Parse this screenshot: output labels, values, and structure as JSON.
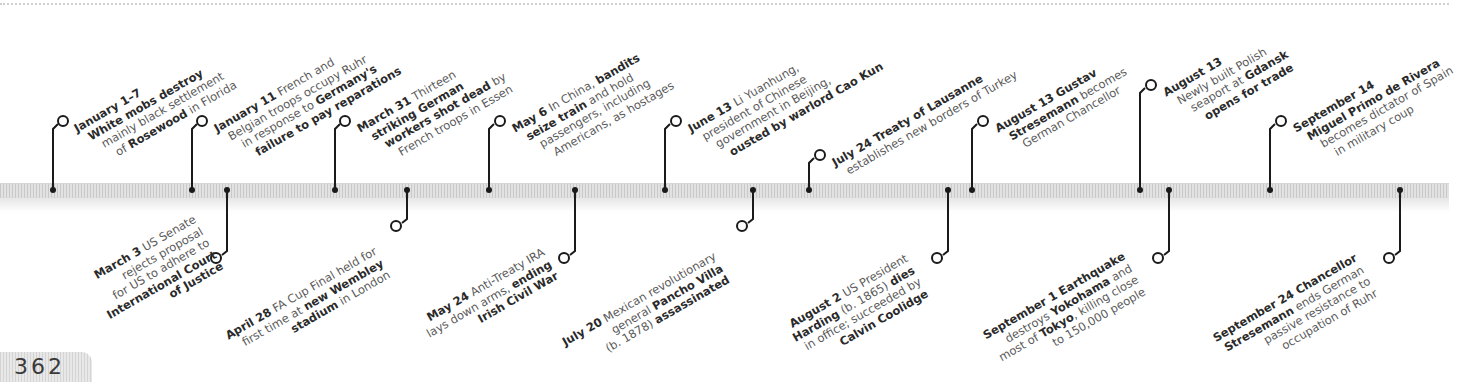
{
  "page": {
    "number": "362"
  },
  "timeline": {
    "year_context": "1923",
    "colors": {
      "bar": "#d9d9d9",
      "connector": "#1a1a1a",
      "bold_text": "#2a2a2a",
      "body_text": "#5a5a5a"
    },
    "top_events": [
      {
        "date": "January 1–7",
        "lines": [
          [
            "",
            "White mobs destroy",
            ""
          ],
          [
            "mainly black settlement",
            "",
            ""
          ],
          [
            "of ",
            "Rosewood",
            " in Florida"
          ]
        ]
      },
      {
        "date": "January 11",
        "lines": [
          [
            "",
            "",
            " French and"
          ],
          [
            "Belgian troops occupy Ruhr",
            "",
            ""
          ],
          [
            "in response to ",
            "Germany's",
            ""
          ],
          [
            "",
            "failure to pay reparations",
            ""
          ]
        ]
      },
      {
        "date": "March 31",
        "lines": [
          [
            "",
            "",
            " Thirteen"
          ],
          [
            "",
            "striking German",
            ""
          ],
          [
            "",
            "workers shot dead",
            " by"
          ],
          [
            "French troops in Essen",
            "",
            ""
          ]
        ]
      },
      {
        "date": "May 6",
        "lines": [
          [
            "In China, ",
            "bandits",
            ""
          ],
          [
            "",
            "seize train",
            " and hold"
          ],
          [
            "passengers, including",
            "",
            ""
          ],
          [
            "Americans, as hostages",
            "",
            ""
          ]
        ]
      },
      {
        "date": "June 13",
        "lines": [
          [
            "",
            "",
            " Li Yuanhung,"
          ],
          [
            "president of Chinese",
            "",
            ""
          ],
          [
            "government in Beijing,",
            "",
            ""
          ],
          [
            "",
            "ousted by warlord Cao Kun",
            ""
          ]
        ]
      },
      {
        "date": "July 24",
        "lines": [
          [
            "",
            "",
            " Treaty of Lausanne"
          ],
          [
            "establishes new borders of Turkey",
            "",
            ""
          ]
        ]
      },
      {
        "date": "August 13",
        "lines": [
          [
            "",
            "",
            " Gustav"
          ],
          [
            "",
            "Stresemann",
            " becomes"
          ],
          [
            "German Chancellor",
            "",
            ""
          ]
        ]
      },
      {
        "date": "August 13",
        "lines": [
          [
            "Newly built Polish",
            "",
            ""
          ],
          [
            "seaport at ",
            "Gdansk",
            ""
          ],
          [
            "",
            "opens for trade",
            ""
          ]
        ]
      },
      {
        "date": "September 14",
        "lines": [
          [
            "",
            "Miguel Primo de Rivera",
            ""
          ],
          [
            "becomes dictator of Spain",
            "",
            ""
          ],
          [
            "in military coup",
            "",
            ""
          ]
        ]
      }
    ],
    "top_events_text": [
      "January 1–7 White mobs destroy mainly black settlement of Rosewood in Florida",
      "January 11 French and Belgian troops occupy Ruhr in response to Germany's failure to pay reparations",
      "March 31 Thirteen striking German workers shot dead by French troops in Essen",
      "May 6 In China, bandits seize train and hold passengers, including Americans, as hostages",
      "June 13 Li Yuanhung, president of Chinese government in Beijing, ousted by warlord Cao Kun",
      "July 24 Treaty of Lausanne establishes new borders of Turkey",
      "August 13 Gustav Stresemann becomes German Chancellor",
      "August 13 Newly built Polish seaport at Gdansk opens for trade",
      "September 14 Miguel Primo de Rivera becomes dictator of Spain in military coup"
    ],
    "bottom_events_text": [
      "March 3 US Senate rejects proposal for US to adhere to International Court of Justice",
      "April 28 FA Cup Final held for first time at new Wembley stadium in London",
      "May 24 Anti-Treaty IRA lays down arms, ending Irish Civil War",
      "July 20 Mexican revolutionary general Pancho Villa (b. 1878) assassinated",
      "August 2 US President Harding (b. 1865) dies in office; succeeded by Calvin Coolidge",
      "September 1 Earthquake destroys Yokohama and most of Tokyo, killing close to 150,000 people",
      "September 24 Chancellor Stresemann ends German passive resistance to occupation of Ruhr"
    ],
    "bottom_events": [
      {
        "date": "March 3",
        "lines": [
          [
            "",
            "",
            " US Senate"
          ],
          [
            "rejects proposal",
            "",
            ""
          ],
          [
            "for US to adhere to",
            "",
            ""
          ],
          [
            "",
            "International Court",
            ""
          ],
          [
            "",
            "of Justice",
            ""
          ]
        ]
      },
      {
        "date": "April 28",
        "lines": [
          [
            "",
            "",
            " FA Cup Final held for"
          ],
          [
            "first time at ",
            "new Wembley",
            ""
          ],
          [
            "",
            "stadium",
            " in London"
          ]
        ]
      },
      {
        "date": "May 24",
        "lines": [
          [
            "",
            "",
            " Anti-Treaty IRA"
          ],
          [
            "lays down arms, ",
            "ending",
            ""
          ],
          [
            "",
            "Irish Civil War",
            ""
          ]
        ]
      },
      {
        "date": "July 20",
        "lines": [
          [
            "",
            "",
            " Mexican revolutionary"
          ],
          [
            "general ",
            "Pancho Villa",
            ""
          ],
          [
            "(b. 1878) ",
            "assassinated",
            ""
          ]
        ]
      },
      {
        "date": "August 2",
        "lines": [
          [
            "",
            "",
            " US President"
          ],
          [
            "",
            "Harding",
            " (b. 1865) "
          ],
          [
            "in office; succeeded by",
            "",
            ""
          ],
          [
            "",
            "Calvin Coolidge",
            ""
          ]
        ]
      },
      {
        "date": "September 1",
        "lines": [
          [
            "",
            "",
            " "
          ],
          [
            "destroys ",
            "Yokohama",
            " and"
          ],
          [
            "most of ",
            "Tokyo",
            ", killing close"
          ],
          [
            "to 150,000 people",
            "",
            ""
          ]
        ]
      },
      {
        "date": "September 24",
        "lines": [
          [
            "",
            "",
            " "
          ],
          [
            "",
            "Stresemann",
            " ends German"
          ],
          [
            "passive resistance to",
            "",
            ""
          ],
          [
            "occupation of Ruhr",
            "",
            ""
          ]
        ]
      }
    ],
    "labels": {
      "t0_date": "January 1–7",
      "t0_l1": "White mobs destroy",
      "t0_l2": "mainly black settlement",
      "t0_l3a": "of ",
      "t0_l3b": "Rosewood",
      "t0_l3c": " in Florida",
      "t1_date": "January 11",
      "t1_l1": " French and",
      "t1_l2": "Belgian troops occupy Ruhr",
      "t1_l3a": "in response to ",
      "t1_l3b": "Germany's",
      "t1_l4": "failure to pay reparations",
      "t2_date": "March 31",
      "t2_l1": " Thirteen",
      "t2_l2": "striking German",
      "t2_l3a": "workers shot dead",
      "t2_l3b": " by",
      "t2_l4": "French troops in Essen",
      "t3_date": "May 6",
      "t3_l1a": " In China, ",
      "t3_l1b": "bandits",
      "t3_l2a": "seize train",
      "t3_l2b": " and hold",
      "t3_l3": "passengers, including",
      "t3_l4": "Americans, as hostages",
      "t4_date": "June 13",
      "t4_l1": " Li Yuanhung,",
      "t4_l2": "president of Chinese",
      "t4_l3": "government in Beijing,",
      "t4_l4": "ousted by warlord Cao Kun",
      "t5_date": "July 24",
      "t5_l1": " Treaty of Lausanne",
      "t5_l2": "establishes new borders of Turkey",
      "t6_date": "August 13",
      "t6_l1": " Gustav",
      "t6_l2a": "Stresemann",
      "t6_l2b": " becomes",
      "t6_l3": "German Chancellor",
      "t7_date": "August 13",
      "t7_l2": "Newly built Polish",
      "t7_l3a": "seaport at ",
      "t7_l3b": "Gdansk",
      "t7_l4": "opens for trade",
      "t8_date": "September 14",
      "t8_l2": "Miguel Primo de Rivera",
      "t8_l3": "becomes dictator of Spain",
      "t8_l4": "in military coup",
      "b0_date": "March 3",
      "b0_l1": " US Senate",
      "b0_l2": "rejects proposal",
      "b0_l3": "for US to adhere to",
      "b0_l4": "International Court",
      "b0_l5": "of Justice",
      "b1_date": "April 28",
      "b1_l1": " FA Cup Final held for",
      "b1_l2a": "first time at ",
      "b1_l2b": "new Wembley",
      "b1_l3a": "stadium",
      "b1_l3b": " in London",
      "b2_date": "May 24",
      "b2_l1": " Anti-Treaty IRA",
      "b2_l2a": "lays down arms, ",
      "b2_l2b": "ending",
      "b2_l3": "Irish Civil War",
      "b3_date": "July 20",
      "b3_l1": " Mexican revolutionary",
      "b3_l2a": "general ",
      "b3_l2b": "Pancho Villa",
      "b3_l3a": "(b. 1878) ",
      "b3_l3b": "assassinated",
      "b4_date": "August 2",
      "b4_l1": " US President",
      "b4_l2a": "Harding",
      "b4_l2b": " (b. 1865) ",
      "b4_l2c": "dies",
      "b4_l3": "in office; succeeded by",
      "b4_l4": "Calvin Coolidge",
      "b5_date": "September 1",
      "b5_l1": " Earthquake",
      "b5_l2a": "destroys ",
      "b5_l2b": "Yokohama",
      "b5_l2c": " and",
      "b5_l3a": "most of ",
      "b5_l3b": "Tokyo",
      "b5_l3c": ", killing close",
      "b5_l4": "to 150,000 people",
      "b6_date": "September 24",
      "b6_l1": " Chancellor",
      "b6_l2a": "Stresemann",
      "b6_l2b": " ends German",
      "b6_l3": "passive resistance to",
      "b6_l4": "occupation of Ruhr"
    }
  }
}
